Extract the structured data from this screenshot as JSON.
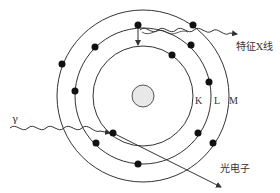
{
  "diagram": {
    "type": "atomic photoelectric effect / characteristic X-ray emission",
    "center": {
      "x": 143,
      "y": 96
    },
    "nucleus": {
      "radius": 11,
      "fill": "#e8e8e8",
      "stroke": "#555555"
    },
    "shells": [
      {
        "name": "K",
        "radius": 50,
        "label": "K",
        "label_pos": {
          "x": 180,
          "y": 96
        }
      },
      {
        "name": "L",
        "radius": 68,
        "label": "L",
        "label_pos": {
          "x": 200,
          "y": 96
        }
      },
      {
        "name": "M",
        "radius": 86,
        "label": "M",
        "label_pos": {
          "x": 215,
          "y": 96
        }
      }
    ],
    "electrons": [
      {
        "shell": "K",
        "x": 172,
        "y": 55
      },
      {
        "shell": "K",
        "x": 113,
        "y": 133,
        "role": "ejected photoelectron origin"
      },
      {
        "shell": "L",
        "x": 138,
        "y": 25,
        "role": "transitioning electron"
      },
      {
        "shell": "L",
        "x": 95,
        "y": 47
      },
      {
        "shell": "L",
        "x": 191,
        "y": 45
      },
      {
        "shell": "L",
        "x": 209,
        "y": 82
      },
      {
        "shell": "L",
        "x": 75,
        "y": 91
      },
      {
        "shell": "L",
        "x": 96,
        "y": 143
      },
      {
        "shell": "L",
        "x": 198,
        "y": 133
      },
      {
        "shell": "L",
        "x": 138,
        "y": 164
      },
      {
        "shell": "M",
        "x": 62,
        "y": 64
      },
      {
        "shell": "M",
        "x": 193,
        "y": 25
      },
      {
        "shell": "M",
        "x": 213,
        "y": 143
      }
    ],
    "labels": {
      "gamma": "γ",
      "characteristic_xray": "特征X线",
      "photoelectron": "光电子",
      "K": "K",
      "L": "L",
      "M": "M"
    },
    "colors": {
      "line": "#333333",
      "electron": "#111111",
      "text": "#333333"
    }
  }
}
